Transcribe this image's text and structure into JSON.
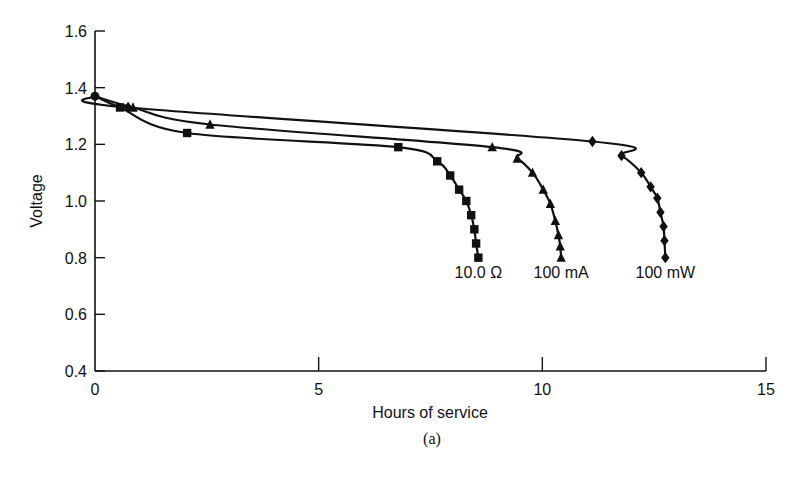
{
  "chart_data": {
    "type": "line",
    "title": "",
    "caption": "(a)",
    "xlabel": "Hours of service",
    "ylabel": "Voltage",
    "xlim": [
      0,
      15
    ],
    "ylim": [
      0.4,
      1.6
    ],
    "xticks": [
      0,
      5,
      10,
      15
    ],
    "yticks": [
      0.4,
      0.6,
      0.8,
      1.0,
      1.2,
      1.4,
      1.6
    ],
    "xtick_labels": [
      "0",
      "5",
      "10",
      "15"
    ],
    "ytick_labels": [
      "0.4",
      "0.6",
      "0.8",
      "1.0",
      "1.2",
      "1.4",
      "1.6"
    ],
    "grid": false,
    "legend_position": "inline labels below curve ends",
    "series": [
      {
        "name": "10.0 Ω",
        "marker": "square",
        "x": [
          0,
          0.56,
          2.06,
          6.78,
          7.65,
          7.94,
          8.14,
          8.3,
          8.41,
          8.48,
          8.52,
          8.57
        ],
        "y": [
          1.37,
          1.33,
          1.24,
          1.19,
          1.14,
          1.09,
          1.04,
          1.0,
          0.95,
          0.9,
          0.85,
          0.8
        ]
      },
      {
        "name": "100 mA",
        "marker": "triangle",
        "x": [
          0,
          0.85,
          2.57,
          8.88,
          9.44,
          9.78,
          10.02,
          10.18,
          10.29,
          10.36,
          10.4,
          10.42
        ],
        "y": [
          1.37,
          1.33,
          1.27,
          1.19,
          1.15,
          1.1,
          1.04,
          0.99,
          0.93,
          0.88,
          0.84,
          0.8
        ]
      },
      {
        "name": "100 mW",
        "marker": "diamond",
        "x": [
          0,
          0.74,
          11.12,
          11.77,
          12.21,
          12.42,
          12.57,
          12.64,
          12.71,
          12.73,
          12.75
        ],
        "y": [
          1.37,
          1.33,
          1.21,
          1.16,
          1.1,
          1.05,
          1.01,
          0.96,
          0.91,
          0.86,
          0.8
        ]
      }
    ]
  },
  "colors": {
    "line": "#111111",
    "background": "#ffffff"
  }
}
